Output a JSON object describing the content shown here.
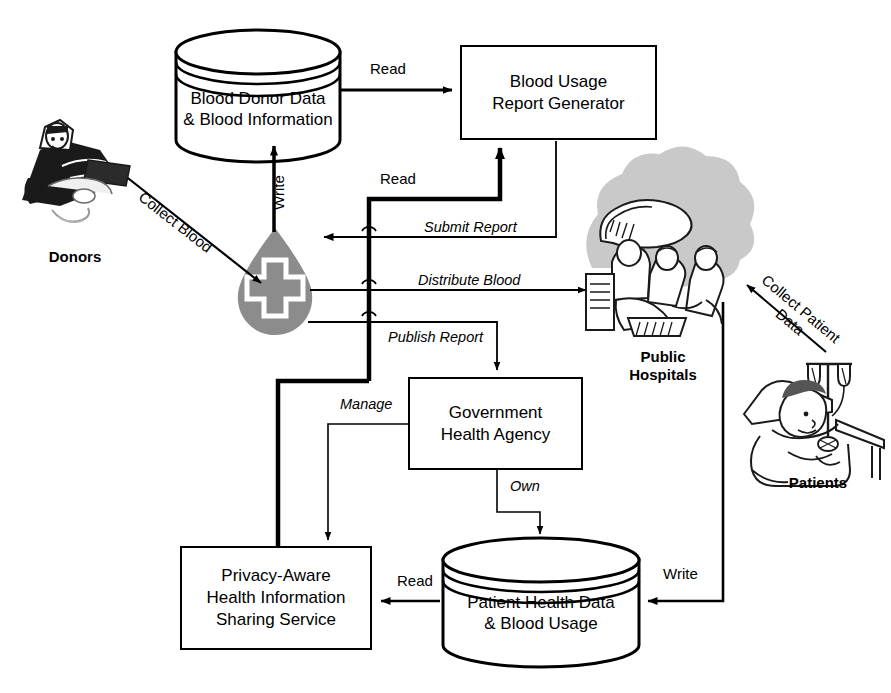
{
  "diagram": {
    "nodes": {
      "blood_donor_db": "Blood Donor  Data\n& Blood Information",
      "report_generator": "Blood Usage\nReport Generator",
      "gov_agency": "Government\nHealth Agency",
      "privacy_service": "Privacy-Aware\nHealth Information\nSharing Service",
      "patient_db": "Patient Health Data\n& Blood Usage"
    },
    "actors": {
      "donors": "Donors",
      "blood_bank": "blood-drop-cross-icon",
      "hospitals": "Public\nHospitals",
      "patients": "Patients"
    },
    "edges": {
      "read_db_to_generator": "Read",
      "write_bank_to_db": "Write",
      "read_bank_to_generator": "Read",
      "collect_blood": "Collect Blood",
      "submit_report": "Submit Report",
      "distribute_blood": "Distribute Blood",
      "publish_report": "Publish Report",
      "manage": "Manage",
      "own": "Own",
      "collect_patient_data": "Collect Patient\nData",
      "read_patient_db": "Read",
      "write_patient_db": "Write"
    },
    "colors": {
      "stroke": "#000000",
      "background": "#ffffff",
      "blood_drop_fill": "#8c8c8c",
      "halo_fill": "#c9c9c9"
    }
  }
}
